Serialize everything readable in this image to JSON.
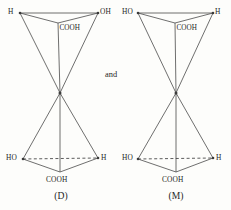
{
  "figure": {
    "kind": "stereochemistry-diagram",
    "conjunction": "and",
    "colors": {
      "background": "#fdfdfb",
      "bond": "#4a4a4a",
      "text": "#1f1f1f"
    }
  },
  "structures": [
    {
      "id": "left",
      "caption": "(D)",
      "top_left_label": "H",
      "top_right_label": "OH",
      "top_center_label": "COOH",
      "bottom_left_label": "HO",
      "bottom_right_label": "H",
      "bottom_center_label": "COOH"
    },
    {
      "id": "right",
      "caption": "(M)",
      "top_left_label": "HO",
      "top_right_label": "H",
      "top_center_label": "COOH",
      "bottom_left_label": "HO",
      "bottom_right_label": "H",
      "bottom_center_label": "COOH"
    }
  ]
}
